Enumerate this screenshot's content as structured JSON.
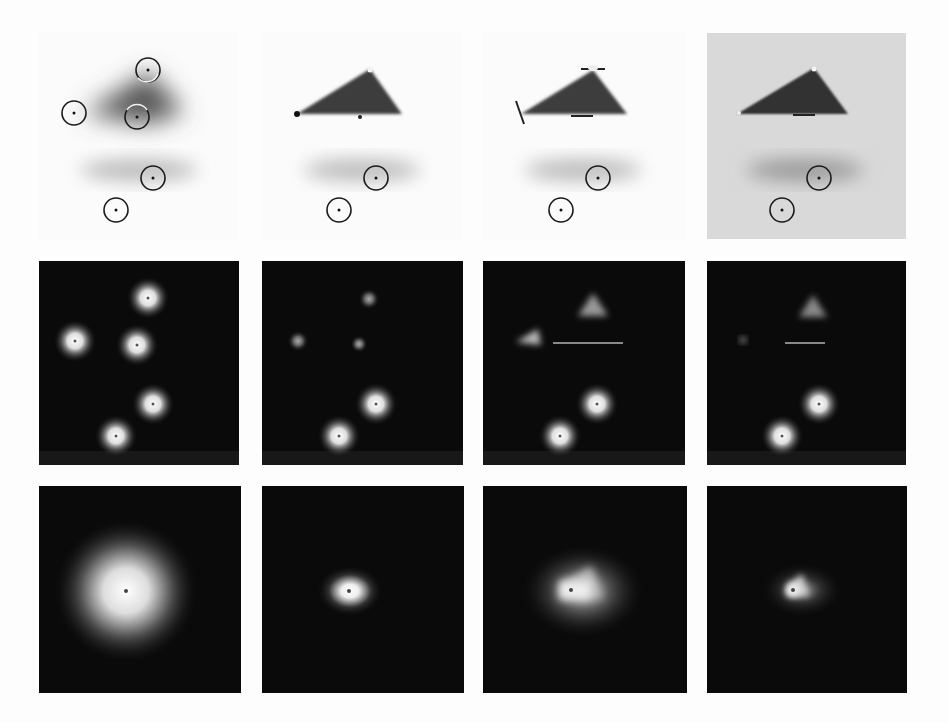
{
  "figure": {
    "colors": {
      "page_background": "#fdfdfd",
      "dark_panel": "#0a0a0a",
      "gray_panel": "#d9d9d9",
      "shape_dark": "#3a3a3a",
      "marker": "#1a1a1a"
    },
    "columns": [
      {
        "x": 39,
        "w": 200
      },
      {
        "x": 262,
        "w": 201
      },
      {
        "x": 483,
        "w": 202
      },
      {
        "x": 707,
        "w": 199
      }
    ],
    "rows": [
      {
        "name": "scene",
        "y": 32,
        "h": 208
      },
      {
        "name": "response-map-points",
        "y": 261,
        "h": 204
      },
      {
        "name": "response-map-combined",
        "y": 486,
        "h": 207
      }
    ],
    "markers": {
      "col1": [
        [
          148,
          70
        ],
        [
          74,
          113
        ],
        [
          137,
          117
        ],
        [
          153,
          178
        ],
        [
          116,
          210
        ]
      ],
      "col2_4": [
        [
          376,
          178
        ],
        [
          339,
          210
        ]
      ]
    }
  }
}
